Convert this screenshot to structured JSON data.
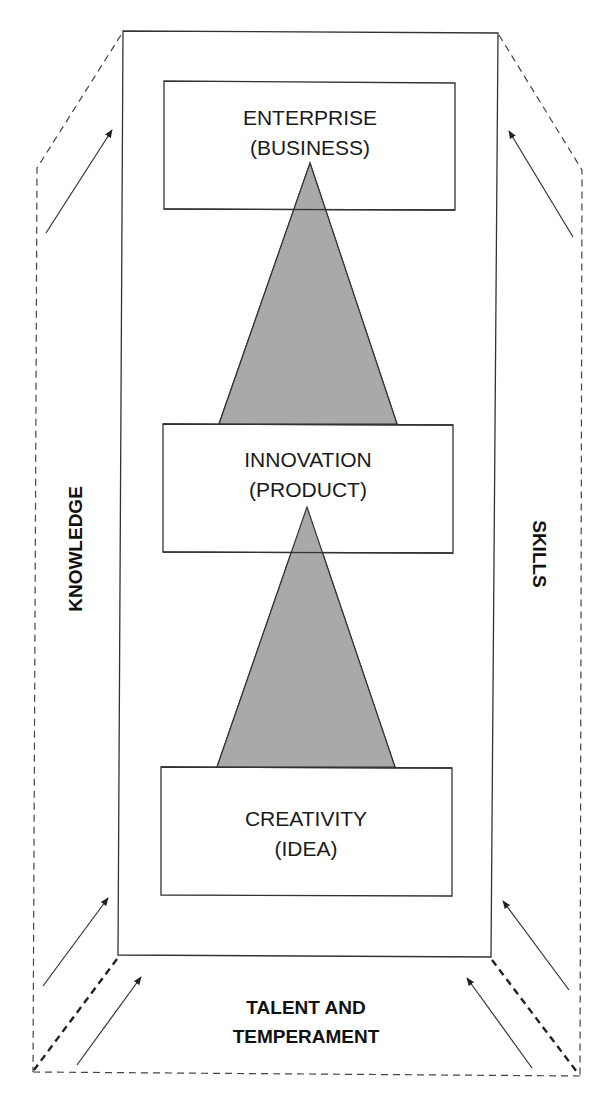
{
  "diagram": {
    "type": "flow",
    "colors": {
      "line": "#333333",
      "triangle_fill": "#a9a9a9",
      "background": "#ffffff"
    },
    "stages": [
      {
        "id": "enterprise",
        "title": "ENTERPRISE",
        "subtitle": "(BUSINESS)"
      },
      {
        "id": "innovation",
        "title": "INNOVATION",
        "subtitle": "(PRODUCT)"
      },
      {
        "id": "creativity",
        "title": "CREATIVITY",
        "subtitle": "(IDEA)"
      }
    ],
    "connectors": [
      {
        "from": "creativity",
        "to": "innovation",
        "shape": "triangle"
      },
      {
        "from": "innovation",
        "to": "enterprise",
        "shape": "triangle"
      }
    ],
    "side_labels": {
      "left": "KNOWLEDGE",
      "right": "SKILLS",
      "bottom_line1": "TALENT AND",
      "bottom_line2": "TEMPERAMENT"
    },
    "arrows": {
      "left": [
        "up-right",
        "up-right"
      ],
      "right": [
        "up-left",
        "up-left"
      ],
      "bottom": [
        "up-right",
        "up-left"
      ]
    }
  }
}
